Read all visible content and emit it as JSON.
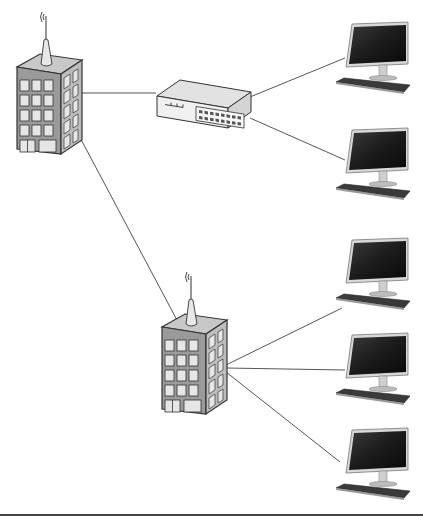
{
  "diagram": {
    "type": "network-topology",
    "colors": {
      "background": "#ffffff",
      "link": "#555555",
      "building_front": "#9a9a9a",
      "building_side": "#bdbdbd",
      "building_top": "#c8c8c8",
      "window": "#e6e6e6",
      "outline": "#333333",
      "switch_body": "#f0f0f0",
      "screen": "#1b1b1b",
      "keyboard": "#3a3a3a",
      "baseline": "#444444"
    },
    "nodes": [
      {
        "id": "building-1",
        "kind": "building-with-antenna",
        "x": 15,
        "y": 12
      },
      {
        "id": "switch",
        "kind": "network-switch",
        "x": 155,
        "y": 76
      },
      {
        "id": "building-2",
        "kind": "building-with-antenna",
        "x": 160,
        "y": 272
      },
      {
        "id": "computer-1",
        "kind": "desktop-computer",
        "x": 330,
        "y": 22
      },
      {
        "id": "computer-2",
        "kind": "desktop-computer",
        "x": 330,
        "y": 128
      },
      {
        "id": "computer-3",
        "kind": "desktop-computer",
        "x": 330,
        "y": 238
      },
      {
        "id": "computer-4",
        "kind": "desktop-computer",
        "x": 330,
        "y": 333
      },
      {
        "id": "computer-5",
        "kind": "desktop-computer",
        "x": 330,
        "y": 428
      }
    ],
    "links": [
      {
        "from": "building-1",
        "to": "switch",
        "x1": 78,
        "y1": 93,
        "x2": 156,
        "y2": 93
      },
      {
        "from": "switch",
        "to": "computer-1",
        "x1": 250,
        "y1": 97,
        "x2": 345,
        "y2": 58
      },
      {
        "from": "switch",
        "to": "computer-2",
        "x1": 250,
        "y1": 118,
        "x2": 345,
        "y2": 160
      },
      {
        "from": "building-1",
        "to": "building-2",
        "x1": 76,
        "y1": 130,
        "x2": 178,
        "y2": 322
      },
      {
        "from": "building-2",
        "to": "computer-3",
        "x1": 226,
        "y1": 365,
        "x2": 342,
        "y2": 308
      },
      {
        "from": "building-2",
        "to": "computer-4",
        "x1": 226,
        "y1": 368,
        "x2": 345,
        "y2": 370
      },
      {
        "from": "building-2",
        "to": "computer-5",
        "x1": 226,
        "y1": 372,
        "x2": 340,
        "y2": 462
      }
    ],
    "baseline": {
      "x1": 0,
      "y1": 515,
      "x2": 423,
      "y2": 515
    }
  }
}
